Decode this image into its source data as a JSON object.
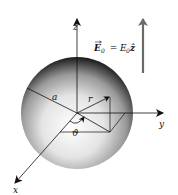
{
  "diagram": {
    "labels": {
      "z_axis": "z",
      "y_axis": "y",
      "x_axis": "x",
      "radius": "a",
      "position": "r",
      "angle": "ϑ",
      "field_lhs": "E",
      "field_lhs_sub": "0",
      "field_eq": " = ",
      "field_rhs": "E",
      "field_rhs_sub": "0",
      "field_unit": "ẑ"
    },
    "colors": {
      "sphere_highlight": "#ffffff",
      "sphere_mid": "#b0b0b0",
      "sphere_edge": "#1a1a1a",
      "axis": "#111111",
      "field_arrow": "#6a6a6a"
    }
  }
}
